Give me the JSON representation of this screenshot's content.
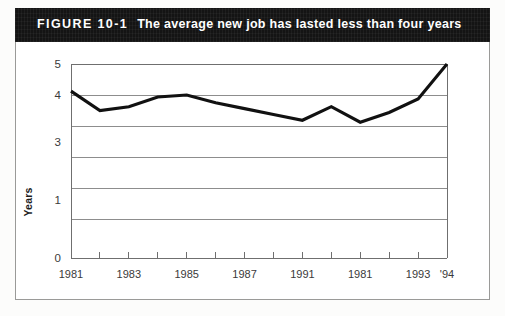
{
  "figure": {
    "label": "FIGURE 10-1",
    "title": "The average new job has lasted less than four years"
  },
  "chart_data": {
    "type": "line",
    "title": "The average new job has lasted less than four years",
    "xlabel": "",
    "ylabel": "Years",
    "categories": [
      "1981",
      "1982",
      "1983",
      "1984",
      "1985",
      "1986",
      "1987",
      "1988",
      "1991",
      "1990",
      "1981",
      "1992",
      "1993",
      "'94"
    ],
    "x_tick_labels": [
      "1981",
      "1983",
      "1985",
      "1987",
      "1991",
      "1981",
      "1993",
      "'94"
    ],
    "y_tick_labels": [
      "5",
      "4",
      "3",
      "1",
      "0"
    ],
    "values": [
      4.3,
      3.8,
      3.9,
      4.15,
      4.2,
      4.0,
      3.85,
      3.7,
      3.55,
      3.9,
      3.5,
      3.75,
      4.1,
      5.0
    ],
    "ylim": [
      0,
      5
    ],
    "grid": true,
    "legend": false,
    "series": [
      {
        "name": "Average job tenure",
        "values": [
          4.3,
          3.8,
          3.9,
          4.15,
          4.2,
          4.0,
          3.85,
          3.7,
          3.55,
          3.9,
          3.5,
          3.75,
          4.1,
          5.0
        ]
      }
    ],
    "line_color": "#111111",
    "gridline_color": "#8d8d8d"
  }
}
